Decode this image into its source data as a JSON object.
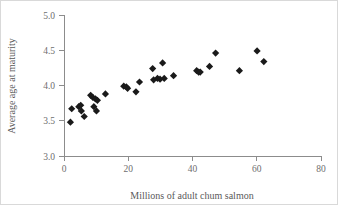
{
  "chart_data": {
    "type": "scatter",
    "title": "",
    "xlabel": "Millions of adult chum salmon",
    "ylabel": "Average age at maturity",
    "xlim": [
      0,
      80
    ],
    "ylim": [
      3.0,
      5.0
    ],
    "xticks": [
      0,
      20,
      40,
      60,
      80
    ],
    "yticks": [
      "3.0",
      "3.5",
      "4.0",
      "4.5",
      "5.0"
    ],
    "xtick_values": [
      0,
      20,
      40,
      60,
      80
    ],
    "ytick_values": [
      3.0,
      3.5,
      4.0,
      4.5,
      5.0
    ],
    "grid": false,
    "legend": null,
    "marker": "diamond",
    "marker_color": "#1a1a1a",
    "series": [
      {
        "name": "chum salmon",
        "points": [
          {
            "x": 2.0,
            "y": 3.48
          },
          {
            "x": 2.4,
            "y": 3.67
          },
          {
            "x": 4.6,
            "y": 3.7
          },
          {
            "x": 5.2,
            "y": 3.72
          },
          {
            "x": 5.4,
            "y": 3.64
          },
          {
            "x": 6.3,
            "y": 3.56
          },
          {
            "x": 8.3,
            "y": 3.86
          },
          {
            "x": 9.0,
            "y": 3.83
          },
          {
            "x": 9.3,
            "y": 3.7
          },
          {
            "x": 9.8,
            "y": 3.81
          },
          {
            "x": 10.1,
            "y": 3.64
          },
          {
            "x": 10.4,
            "y": 3.79
          },
          {
            "x": 12.9,
            "y": 3.88
          },
          {
            "x": 18.6,
            "y": 3.99
          },
          {
            "x": 19.4,
            "y": 3.98
          },
          {
            "x": 19.8,
            "y": 3.96
          },
          {
            "x": 22.4,
            "y": 3.91
          },
          {
            "x": 23.5,
            "y": 4.05
          },
          {
            "x": 27.6,
            "y": 4.24
          },
          {
            "x": 27.9,
            "y": 4.08
          },
          {
            "x": 29.1,
            "y": 4.1
          },
          {
            "x": 29.9,
            "y": 4.09
          },
          {
            "x": 30.7,
            "y": 4.32
          },
          {
            "x": 31.2,
            "y": 4.1
          },
          {
            "x": 34.1,
            "y": 4.14
          },
          {
            "x": 41.3,
            "y": 4.21
          },
          {
            "x": 41.9,
            "y": 4.19
          },
          {
            "x": 42.4,
            "y": 4.19
          },
          {
            "x": 45.3,
            "y": 4.27
          },
          {
            "x": 47.2,
            "y": 4.46
          },
          {
            "x": 54.6,
            "y": 4.21
          },
          {
            "x": 60.1,
            "y": 4.49
          },
          {
            "x": 62.2,
            "y": 4.34
          }
        ]
      }
    ]
  },
  "axes": {
    "y_title": "Average age at maturity",
    "x_title": "Millions of adult chum salmon"
  }
}
